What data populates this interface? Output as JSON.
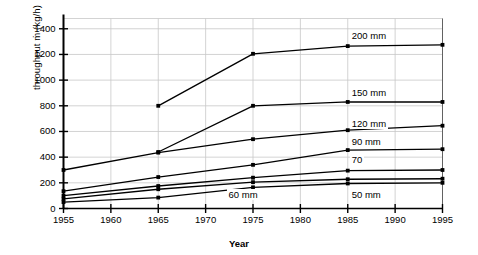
{
  "chart_data": {
    "type": "line",
    "title": "",
    "xlabel": "Year",
    "ylabel": "throughput ṁ (kg/h)",
    "ylabel_plain": "throughput m (kg/h)",
    "x": [
      1955,
      1960,
      1965,
      1970,
      1975,
      1980,
      1985,
      1990,
      1995
    ],
    "xlim": [
      1955,
      1995
    ],
    "ylim": [
      0,
      1480
    ],
    "xticks": [
      "1955",
      "1960",
      "1965",
      "1970",
      "1975",
      "1980",
      "1985",
      "1990",
      "1995"
    ],
    "yticks": [
      "0",
      "200",
      "400",
      "600",
      "800",
      "1000",
      "1200",
      "1400"
    ],
    "ytick_values": [
      0,
      200,
      400,
      600,
      800,
      1000,
      1200,
      1400
    ],
    "grid": true,
    "legend": "inline-right-of-series",
    "marker": "square",
    "line_color": "#000000",
    "grid_color": "#c8c8c8",
    "axis_color": "#000000",
    "background": "#ffffff",
    "series": [
      {
        "name": "200 mm",
        "label": "200 mm",
        "label_x": 1985,
        "label_y": 1340,
        "points": [
          {
            "x": 1965,
            "y": 800
          },
          {
            "x": 1975,
            "y": 1205
          },
          {
            "x": 1985,
            "y": 1265
          },
          {
            "x": 1995,
            "y": 1275
          }
        ]
      },
      {
        "name": "150 mm",
        "label": "150 mm",
        "label_x": 1985,
        "label_y": 900,
        "points": [
          {
            "x": 1965,
            "y": 440
          },
          {
            "x": 1975,
            "y": 800
          },
          {
            "x": 1985,
            "y": 830
          },
          {
            "x": 1995,
            "y": 830
          }
        ]
      },
      {
        "name": "120 mm",
        "label": "120 mm",
        "label_x": 1985,
        "label_y": 660,
        "points": [
          {
            "x": 1955,
            "y": 300
          },
          {
            "x": 1965,
            "y": 435
          },
          {
            "x": 1975,
            "y": 540
          },
          {
            "x": 1985,
            "y": 610
          },
          {
            "x": 1995,
            "y": 645
          }
        ]
      },
      {
        "name": "90 mm",
        "label": "90 mm",
        "label_x": 1985,
        "label_y": 520,
        "points": [
          {
            "x": 1955,
            "y": 135
          },
          {
            "x": 1965,
            "y": 245
          },
          {
            "x": 1975,
            "y": 340
          },
          {
            "x": 1985,
            "y": 455
          },
          {
            "x": 1995,
            "y": 462
          }
        ]
      },
      {
        "name": "70",
        "label": "70",
        "label_x": 1985,
        "label_y": 375,
        "points": [
          {
            "x": 1955,
            "y": 100
          },
          {
            "x": 1965,
            "y": 175
          },
          {
            "x": 1975,
            "y": 240
          },
          {
            "x": 1985,
            "y": 295
          },
          {
            "x": 1995,
            "y": 300
          }
        ]
      },
      {
        "name": "60 mm",
        "label": "60 mm",
        "label_x": 1972,
        "label_y": 105,
        "points": [
          {
            "x": 1955,
            "y": 75
          },
          {
            "x": 1965,
            "y": 150
          },
          {
            "x": 1975,
            "y": 205
          },
          {
            "x": 1985,
            "y": 228
          },
          {
            "x": 1995,
            "y": 232
          }
        ]
      },
      {
        "name": "50 mm",
        "label": "50 mm",
        "label_x": 1985,
        "label_y": 105,
        "points": [
          {
            "x": 1955,
            "y": 50
          },
          {
            "x": 1965,
            "y": 85
          },
          {
            "x": 1975,
            "y": 165
          },
          {
            "x": 1985,
            "y": 195
          },
          {
            "x": 1995,
            "y": 200
          }
        ]
      }
    ]
  }
}
